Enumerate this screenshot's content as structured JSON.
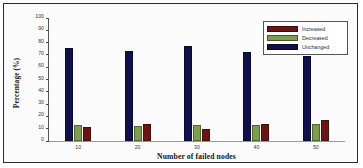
{
  "chart_data": {
    "type": "bar",
    "title": "",
    "subtitle": "",
    "xlabel": "Number of failed nodes",
    "ylabel": "Percentage (%)",
    "categories": [
      "10",
      "20",
      "30",
      "40",
      "50"
    ],
    "ylim": [
      0,
      100
    ],
    "ytick_labels": [
      "0",
      "10",
      "20",
      "30",
      "40",
      "50",
      "60",
      "70",
      "80",
      "90",
      "100"
    ],
    "ytick_values": [
      0,
      10,
      20,
      30,
      40,
      50,
      60,
      70,
      80,
      90,
      100
    ],
    "grid": false,
    "legend_position": "top-right",
    "series": [
      {
        "name": "Increased",
        "color": "#6B1414",
        "values": [
          11,
          14,
          9.5,
          14,
          17
        ]
      },
      {
        "name": "Decreased",
        "color": "#7D9E4E",
        "values": [
          13,
          12,
          13,
          13,
          14
        ]
      },
      {
        "name": "Unchanged",
        "color": "#10104A",
        "values": [
          76,
          73.5,
          77.5,
          72.5,
          69
        ]
      }
    ],
    "bar_draw_order": [
      "Unchanged",
      "Decreased",
      "Increased"
    ]
  }
}
